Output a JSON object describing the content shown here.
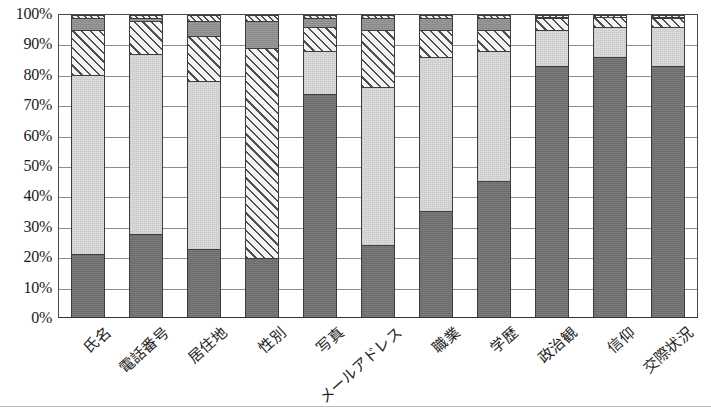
{
  "chart_data": {
    "type": "bar",
    "subtype": "100% stacked bar",
    "title": "",
    "xlabel": "",
    "ylabel": "",
    "ylim": [
      0,
      100
    ],
    "grid": true,
    "legend_position": "none",
    "y_tick_labels": [
      "100%",
      "90%",
      "80%",
      "70%",
      "60%",
      "50%",
      "40%",
      "30%",
      "20%",
      "10%",
      "0%"
    ],
    "y_tick_values": [
      100,
      90,
      80,
      70,
      60,
      50,
      40,
      30,
      20,
      10,
      0
    ],
    "categories": [
      "氏名",
      "電話番号",
      "居住地",
      "性別",
      "写真",
      "メールアドレス",
      "職業",
      "学歴",
      "政治観",
      "信仰",
      "交際状況"
    ],
    "series": [
      {
        "name": "series-1-dark-gray",
        "fill": "dark-gray-solid",
        "color": "#6f6f6f",
        "values": [
          21,
          27.5,
          22.5,
          19.5,
          74,
          24,
          35,
          45,
          83,
          86,
          83
        ]
      },
      {
        "name": "series-2-light-gray",
        "fill": "light-gray-solid",
        "color": "#dedede",
        "values": [
          59,
          59.5,
          55.5,
          0,
          14,
          52,
          51,
          43,
          12,
          10,
          13
        ]
      },
      {
        "name": "series-3-diagonal-hatch",
        "fill": "diagonal-hatch",
        "color": "#f2f2f2",
        "values": [
          15,
          11,
          15,
          69.5,
          8,
          19,
          9,
          7,
          4,
          3.5,
          3
        ]
      },
      {
        "name": "series-4-medium-gray",
        "fill": "medium-gray-solid",
        "color": "#8e8e8e",
        "values": [
          4,
          1,
          5,
          9,
          3,
          4,
          4,
          4,
          0.5,
          0,
          0.5
        ]
      },
      {
        "name": "series-5-top-hatch",
        "fill": "fine-diagonal-hatch",
        "color": "#f2f2f2",
        "values": [
          1,
          1,
          2,
          2,
          1,
          1,
          1,
          1,
          0.5,
          0.5,
          0.5
        ]
      }
    ]
  },
  "axis": {
    "y_axis_name": "percentage-axis",
    "x_axis_name": "category-axis"
  }
}
